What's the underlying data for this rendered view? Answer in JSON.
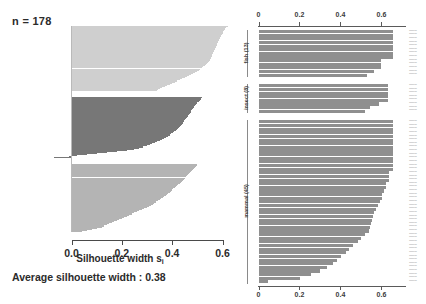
{
  "left_panel": {
    "n_label": "n = 178",
    "xlabel_main": "Silhouette width s",
    "xlabel_sub": "i",
    "average_label": "Average silhouette width :  0.38",
    "average_value": 0.38,
    "tick_labels": [
      "0.0",
      "0.2",
      "0.4",
      "0.6"
    ],
    "tick_values": [
      0.0,
      0.2,
      0.4,
      0.6
    ],
    "cluster_colors": [
      "#cfcfcf",
      "#777777",
      "#b4b4b4"
    ]
  },
  "right_panel": {
    "tick_labels": [
      "0",
      "0.2",
      "0.4",
      "0.6"
    ],
    "tick_values": [
      0.0,
      0.2,
      0.4,
      0.6
    ],
    "bar_color": "#8f8f8f",
    "groups": [
      {
        "name": "fish (13)",
        "label": "fish (13)",
        "count": 13
      },
      {
        "name": "insect (8)",
        "label": "insect (8)",
        "count": 8
      },
      {
        "name": "mammal (45)",
        "label": "mammal (45)",
        "count": 45
      }
    ]
  },
  "bottom_caption": "",
  "chart_data": [
    {
      "type": "bar",
      "id": "silhouette-plot",
      "title": "",
      "xlabel": "Silhouette width s_i",
      "ylabel": "",
      "xlim": [
        -0.12,
        0.68
      ],
      "grid": false,
      "annotations": [
        "n = 178",
        "Average silhouette width :  0.38"
      ],
      "clusters": [
        {
          "name": "cluster-1",
          "color": "#cfcfcf",
          "values": [
            0.62,
            0.615,
            0.61,
            0.608,
            0.605,
            0.602,
            0.6,
            0.598,
            0.596,
            0.594,
            0.592,
            0.59,
            0.588,
            0.586,
            0.584,
            0.582,
            0.58,
            0.578,
            0.576,
            0.574,
            0.572,
            0.57,
            0.568,
            0.566,
            0.564,
            0.562,
            0.56,
            0.558,
            0.556,
            0.554,
            0.552,
            0.55,
            0.546,
            0.542,
            0.538,
            0.534,
            0.53,
            0.524,
            0.518,
            0.512,
            0.506,
            0.5,
            0.492,
            0.484,
            0.476,
            0.468,
            0.46,
            0.45,
            0.44,
            0.43,
            0.42,
            0.41,
            0.4,
            0.39,
            0.38,
            0.37,
            0.36,
            0.35,
            0.345,
            0.34
          ]
        },
        {
          "name": "cluster-2",
          "color": "#777777",
          "values": [
            0.52,
            0.515,
            0.51,
            0.505,
            0.5,
            0.497,
            0.494,
            0.491,
            0.488,
            0.485,
            0.482,
            0.479,
            0.476,
            0.473,
            0.47,
            0.467,
            0.464,
            0.461,
            0.458,
            0.455,
            0.452,
            0.449,
            0.446,
            0.443,
            0.44,
            0.436,
            0.432,
            0.428,
            0.424,
            0.42,
            0.414,
            0.408,
            0.402,
            0.396,
            0.39,
            0.382,
            0.374,
            0.366,
            0.358,
            0.35,
            0.34,
            0.33,
            0.32,
            0.31,
            0.3,
            0.285,
            0.27,
            0.25,
            0.22,
            0.18,
            0.14,
            0.1,
            0.06,
            0.02,
            -0.01,
            -0.07
          ]
        },
        {
          "name": "cluster-3",
          "color": "#b4b4b4",
          "values": [
            0.5,
            0.495,
            0.49,
            0.486,
            0.482,
            0.478,
            0.474,
            0.47,
            0.466,
            0.462,
            0.458,
            0.454,
            0.45,
            0.446,
            0.442,
            0.438,
            0.434,
            0.43,
            0.425,
            0.42,
            0.415,
            0.41,
            0.405,
            0.4,
            0.395,
            0.39,
            0.385,
            0.38,
            0.374,
            0.368,
            0.362,
            0.356,
            0.35,
            0.343,
            0.336,
            0.329,
            0.322,
            0.315,
            0.308,
            0.3,
            0.29,
            0.28,
            0.27,
            0.26,
            0.25,
            0.24,
            0.23,
            0.22,
            0.21,
            0.2,
            0.19,
            0.18,
            0.17,
            0.16,
            0.15,
            0.14,
            0.13,
            0.12,
            0.1,
            0.08,
            0.06,
            0.04
          ]
        }
      ]
    },
    {
      "type": "bar",
      "id": "grouped-bar-plot",
      "title": "",
      "xlabel": "",
      "ylabel": "",
      "xlim": [
        0,
        0.72
      ],
      "grid": false,
      "orientation": "horizontal",
      "groups": [
        {
          "name": "fish (13)",
          "values": [
            0.655,
            0.655,
            0.655,
            0.655,
            0.655,
            0.655,
            0.655,
            0.655,
            0.6,
            0.6,
            0.6,
            0.565,
            0.53
          ]
        },
        {
          "name": "insect (8)",
          "values": [
            0.63,
            0.63,
            0.63,
            0.63,
            0.63,
            0.59,
            0.545,
            0.52
          ]
        },
        {
          "name": "mammal (45)",
          "values": [
            0.655,
            0.655,
            0.655,
            0.655,
            0.655,
            0.655,
            0.655,
            0.655,
            0.655,
            0.655,
            0.655,
            0.655,
            0.655,
            0.655,
            0.635,
            0.635,
            0.635,
            0.62,
            0.62,
            0.615,
            0.605,
            0.605,
            0.595,
            0.585,
            0.575,
            0.565,
            0.56,
            0.555,
            0.55,
            0.545,
            0.54,
            0.52,
            0.5,
            0.485,
            0.46,
            0.44,
            0.425,
            0.405,
            0.385,
            0.365,
            0.335,
            0.3,
            0.255,
            0.205,
            0.045
          ]
        }
      ]
    }
  ]
}
